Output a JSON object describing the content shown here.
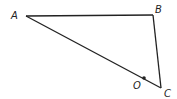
{
  "diagram": {
    "type": "triangle",
    "vertices": [
      {
        "label": "A",
        "x": 26,
        "y": 16,
        "label_x": 11,
        "label_y": 19
      },
      {
        "label": "B",
        "x": 153,
        "y": 15,
        "label_x": 155,
        "label_y": 13
      },
      {
        "label": "C",
        "x": 161,
        "y": 88,
        "label_x": 164,
        "label_y": 97
      }
    ],
    "point": {
      "label": "O",
      "x": 144,
      "y": 78,
      "label_x": 133,
      "label_y": 89,
      "on_segment": "AC"
    },
    "segments": [
      "AB",
      "BC",
      "CA"
    ],
    "colors": {
      "stroke": "#222222",
      "background": "#ffffff"
    }
  }
}
